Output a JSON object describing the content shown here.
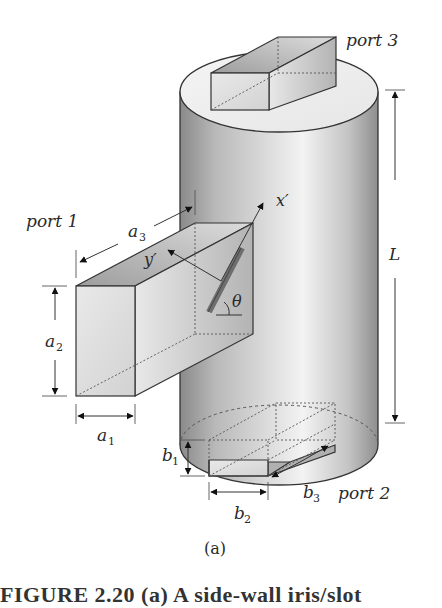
{
  "figure": {
    "subfigure_label": "(a)",
    "caption_partial": "FIGURE 2.20 (a) A side-wall iris/slot",
    "labels": {
      "port1": "port 1",
      "port2": "port 2",
      "port3": "port 3",
      "L": "L",
      "a1": "a",
      "a1_sub": "1",
      "a2": "a",
      "a2_sub": "2",
      "a3": "a",
      "a3_sub": "3",
      "b1": "b",
      "b1_sub": "1",
      "b2": "b",
      "b2_sub": "2",
      "b3": "b",
      "b3_sub": "3",
      "x_prime": "x′",
      "y_prime": "y′",
      "theta": "θ"
    },
    "colors": {
      "outline": "#333333",
      "slot": "#6e6e6e",
      "cylinder_dark": "#8c8c8c",
      "cylinder_light": "#f0f0f0",
      "box_fill": "#e4e4e4"
    }
  }
}
